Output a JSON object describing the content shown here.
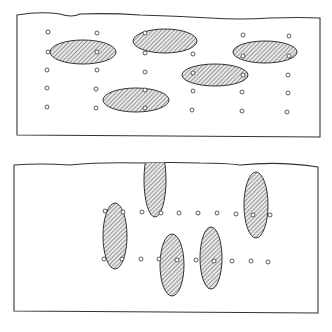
{
  "figure": {
    "colors": {
      "stroke": "#333333",
      "hatch": "#555555",
      "fill": "#e8e8e8",
      "background": "#ffffff"
    },
    "panels": [
      {
        "name": "top-panel",
        "frame": {
          "x": 17,
          "y": 14,
          "w": 303,
          "h": 123
        },
        "ellipses": [
          {
            "cx": 83,
            "cy": 52,
            "rx": 33,
            "ry": 12,
            "rot": 0
          },
          {
            "cx": 165,
            "cy": 41,
            "rx": 32,
            "ry": 12,
            "rot": 0
          },
          {
            "cx": 265,
            "cy": 52,
            "rx": 32,
            "ry": 11,
            "rot": 0
          },
          {
            "cx": 215,
            "cy": 75,
            "rx": 33,
            "ry": 11,
            "rot": 0
          },
          {
            "cx": 136,
            "cy": 100,
            "rx": 33,
            "ry": 12,
            "rot": 0
          }
        ],
        "points": [
          [
            48,
            32
          ],
          [
            97,
            33
          ],
          [
            145,
            33
          ],
          [
            243,
            35
          ],
          [
            289,
            36
          ],
          [
            48,
            52
          ],
          [
            97,
            52
          ],
          [
            145,
            53
          ],
          [
            193,
            54
          ],
          [
            243,
            56
          ],
          [
            289,
            56
          ],
          [
            47,
            70
          ],
          [
            97,
            70
          ],
          [
            145,
            72
          ],
          [
            193,
            73
          ],
          [
            243,
            75
          ],
          [
            288,
            75
          ],
          [
            47,
            88
          ],
          [
            96,
            89
          ],
          [
            145,
            90
          ],
          [
            193,
            91
          ],
          [
            242,
            92
          ],
          [
            288,
            93
          ],
          [
            47,
            107
          ],
          [
            96,
            108
          ],
          [
            145,
            108
          ],
          [
            192,
            110
          ],
          [
            242,
            111
          ],
          [
            287,
            112
          ]
        ]
      },
      {
        "name": "bottom-panel",
        "frame": {
          "x": 14,
          "y": 163,
          "w": 304,
          "h": 150
        },
        "ellipses": [
          {
            "cx": 115,
            "cy": 236,
            "rx": 12,
            "ry": 33,
            "rot": 0
          },
          {
            "cx": 155,
            "cy": 180,
            "rx": 11,
            "ry": 37,
            "rot": 0
          },
          {
            "cx": 256,
            "cy": 205,
            "rx": 12,
            "ry": 33,
            "rot": 0
          },
          {
            "cx": 211,
            "cy": 258,
            "rx": 11,
            "ry": 31,
            "rot": 0
          },
          {
            "cx": 172,
            "cy": 265,
            "rx": 12,
            "ry": 31,
            "rot": 0
          }
        ],
        "points": [
          [
            105,
            211
          ],
          [
            123,
            212
          ],
          [
            142,
            212
          ],
          [
            161,
            213
          ],
          [
            179,
            213
          ],
          [
            198,
            213
          ],
          [
            217,
            213
          ],
          [
            236,
            214
          ],
          [
            253,
            215
          ],
          [
            270,
            215
          ],
          [
            104,
            259
          ],
          [
            122,
            259
          ],
          [
            141,
            259
          ],
          [
            159,
            259
          ],
          [
            177,
            260
          ],
          [
            196,
            260
          ],
          [
            214,
            261
          ],
          [
            232,
            261
          ],
          [
            251,
            261
          ],
          [
            268,
            262
          ]
        ]
      }
    ]
  }
}
